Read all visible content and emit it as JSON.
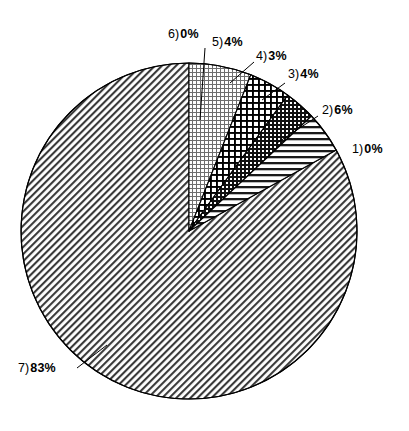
{
  "chart_data": {
    "type": "pie",
    "title": "",
    "subtitle": "",
    "xlabel": "",
    "ylabel": "",
    "legend_position": "none",
    "grid": false,
    "categories": [
      "1)",
      "2)",
      "3)",
      "4)",
      "5)",
      "6)",
      "7)"
    ],
    "values": [
      0,
      6,
      4,
      3,
      4,
      0,
      83
    ],
    "value_labels": [
      "0%",
      "6%",
      "4%",
      "3%",
      "4%",
      "0%",
      "83%"
    ],
    "units": "percent",
    "total": 100,
    "start_angle_deg": -90,
    "direction": "clockwise",
    "center": {
      "x": 189,
      "y": 231
    },
    "radius": 168,
    "slices": [
      {
        "id": "slice-1",
        "index_label": "1)",
        "percent_label": "0%",
        "value": 0,
        "pattern": "none",
        "has_leader": false
      },
      {
        "id": "slice-2",
        "index_label": "2)",
        "percent_label": "6%",
        "value": 6,
        "pattern": "fine-dot-grid",
        "has_leader": true
      },
      {
        "id": "slice-3",
        "index_label": "3)",
        "percent_label": "4%",
        "value": 4,
        "pattern": "bold-grid",
        "has_leader": true
      },
      {
        "id": "slice-4",
        "index_label": "4)",
        "percent_label": "3%",
        "value": 3,
        "pattern": "dense-crosshatch",
        "has_leader": true
      },
      {
        "id": "slice-5",
        "index_label": "5)",
        "percent_label": "4%",
        "value": 4,
        "pattern": "horizontal-lines",
        "has_leader": true
      },
      {
        "id": "slice-6",
        "index_label": "6)",
        "percent_label": "0%",
        "value": 0,
        "pattern": "none",
        "has_leader": false
      },
      {
        "id": "slice-7",
        "index_label": "7)",
        "percent_label": "83%",
        "value": 83,
        "pattern": "diagonal-hatch",
        "has_leader": true
      }
    ],
    "colors": {
      "stroke": "#000000",
      "background": "#ffffff",
      "pattern_ink": "#000000"
    }
  },
  "labels": {
    "l1": {
      "index": "1)",
      "pct": "0%"
    },
    "l2": {
      "index": "2)",
      "pct": "6%"
    },
    "l3": {
      "index": "3)",
      "pct": "4%"
    },
    "l4": {
      "index": "4)",
      "pct": "3%"
    },
    "l5": {
      "index": "5)",
      "pct": "4%"
    },
    "l6": {
      "index": "6)",
      "pct": "0%"
    },
    "l7": {
      "index": "7)",
      "pct": "83%"
    }
  }
}
